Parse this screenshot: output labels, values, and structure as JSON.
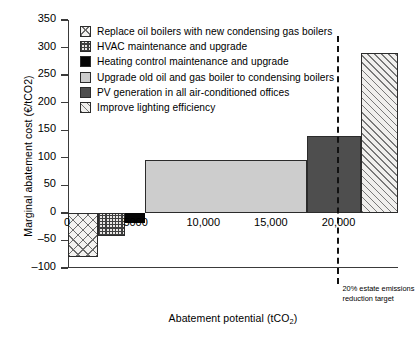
{
  "chart_data": {
    "type": "bar",
    "title": "",
    "xlabel": "Abatement potential (tCO2)",
    "xlabel_main": "Abatement potential (tCO",
    "xlabel_sub": "2",
    "xlabel_tail": ")",
    "ylabel": "Marginal abatement cost (€/tCO2)",
    "ylim": [
      -100,
      350
    ],
    "xlim": [
      0,
      24400
    ],
    "yticks": [
      350,
      300,
      250,
      200,
      150,
      100,
      50,
      0,
      -50,
      -100
    ],
    "ytick_labels": [
      "350",
      "300",
      "250",
      "200",
      "150",
      "100",
      "50",
      "0",
      "–50",
      "–100"
    ],
    "xtick_labels": [
      "0",
      "5000",
      "10,000",
      "15,000",
      "20,000"
    ],
    "xticks": [
      0,
      5000,
      10000,
      15000,
      20000
    ],
    "grid": false,
    "legend_position": "upper-left-inside",
    "bars": [
      {
        "label": "Replace oil boilers with new condensing gas boilers",
        "pattern": "cross-hatch",
        "x_start": 0,
        "x_end": 2200,
        "width": 2200,
        "cost": -80
      },
      {
        "label": "HVAC maintenance and upgrade",
        "pattern": "checker",
        "x_start": 2200,
        "x_end": 4200,
        "width": 2000,
        "cost": -42
      },
      {
        "label": "Heating control maintenance and upgrade",
        "pattern": "solid-black",
        "x_start": 4200,
        "x_end": 5700,
        "width": 1500,
        "cost": -18
      },
      {
        "label": "Upgrade old oil and gas boiler to condensing boilers",
        "pattern": "light-grey",
        "x_start": 5700,
        "x_end": 17700,
        "width": 12000,
        "cost": 96
      },
      {
        "label": "PV generation in all air-conditioned offices",
        "pattern": "dark-grey",
        "x_start": 17700,
        "x_end": 21700,
        "width": 4000,
        "cost": 140
      },
      {
        "label": "Improve lighting efficiency",
        "pattern": "diagonal-hatch",
        "x_start": 21700,
        "x_end": 24400,
        "width": 2700,
        "cost": 290
      }
    ],
    "annotations": [
      {
        "type": "vline",
        "x": 20000,
        "style": "dashed",
        "label_line1": "20% estate emissions",
        "label_line2": "reduction target"
      }
    ],
    "legend": [
      {
        "label": "Replace oil boilers with new condensing gas boilers",
        "pattern": "cross-hatch"
      },
      {
        "label": "HVAC maintenance and upgrade",
        "pattern": "checker"
      },
      {
        "label": "Heating control maintenance and upgrade",
        "pattern": "solid-black"
      },
      {
        "label": "Upgrade old oil and gas boiler to condensing boilers",
        "pattern": "light-grey"
      },
      {
        "label": "PV generation in all air-conditioned offices",
        "pattern": "dark-grey"
      },
      {
        "label": "Improve lighting efficiency",
        "pattern": "diagonal-hatch"
      }
    ]
  }
}
